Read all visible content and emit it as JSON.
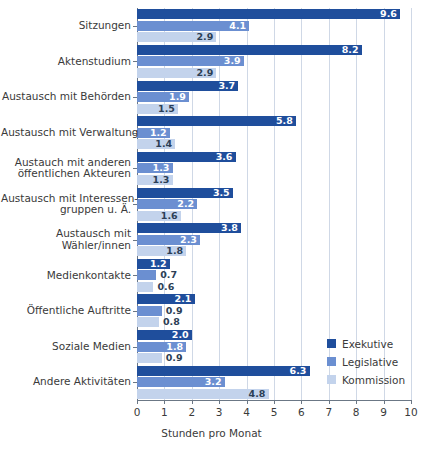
{
  "chart_data": {
    "type": "bar",
    "orientation": "horizontal",
    "title": "",
    "xlabel": "Stunden pro Monat",
    "ylabel": "",
    "xlim": [
      0,
      10
    ],
    "xticks": [
      "0",
      "1",
      "2",
      "3",
      "4",
      "5",
      "6",
      "7",
      "8",
      "9",
      "10"
    ],
    "grid": "vertical",
    "legend_position": "bottom-right",
    "categories": [
      "Sitzungen",
      "Aktenstudium",
      "Austausch mit Behörden",
      "Austausch mit Verwaltung",
      "Austauch mit anderen\növentlichen Akteuren",
      "Austausch mit Interessen-\ngruppen u. Ä.",
      "Austausch mit\nWähler/innen",
      "Medienkontakte",
      "Öffentliche Auftritte",
      "Soziale Medien",
      "Andere Aktivitäten"
    ],
    "category_lines": [
      [
        "Sitzungen"
      ],
      [
        "Aktenstudium"
      ],
      [
        "Austausch mit Behörden"
      ],
      [
        "Austausch mit Verwaltung"
      ],
      [
        "Austauch mit anderen",
        "öffentlichen Akteuren"
      ],
      [
        "Austausch mit Interessen-",
        "gruppen u. Ä."
      ],
      [
        "Austausch mit",
        "Wähler/innen"
      ],
      [
        "Medienkontakte"
      ],
      [
        "Öffentliche Auftritte"
      ],
      [
        "Soziale Medien"
      ],
      [
        "Andere Aktivitäten"
      ]
    ],
    "series": [
      {
        "name": "Exekutive",
        "color": "#1f4e9c",
        "values": [
          9.6,
          8.2,
          3.7,
          5.8,
          3.6,
          3.5,
          3.8,
          1.2,
          2.1,
          2.0,
          6.3
        ],
        "labels": [
          "9.6",
          "8.2",
          "3.7",
          "5.8",
          "3.6",
          "3.5",
          "3.8",
          "1.2",
          "2.1",
          "2.0",
          "6.3"
        ]
      },
      {
        "name": "Legislative",
        "color": "#6b8fd1",
        "values": [
          4.1,
          3.9,
          1.9,
          1.2,
          1.3,
          2.2,
          2.3,
          0.7,
          0.9,
          1.8,
          3.2
        ],
        "labels": [
          "4.1",
          "3.9",
          "1.9",
          "1.2",
          "1.3",
          "2.2",
          "2.3",
          "0.7",
          "0.9",
          "1.8",
          "3.2"
        ]
      },
      {
        "name": "Kommission",
        "color": "#c3d3ec",
        "values": [
          2.9,
          2.9,
          1.5,
          1.4,
          1.3,
          1.6,
          1.8,
          0.6,
          0.8,
          0.9,
          4.8
        ],
        "labels": [
          "2.9",
          "2.9",
          "1.5",
          "1.4",
          "1.3",
          "1.6",
          "1.8",
          "0.6",
          "0.8",
          "0.9",
          "4.8"
        ]
      }
    ]
  },
  "legend": {
    "items": [
      {
        "label": "Exekutive"
      },
      {
        "label": "Legislative"
      },
      {
        "label": "Kommission"
      }
    ]
  },
  "axis": {
    "x_title": "Stunden pro Monat"
  }
}
